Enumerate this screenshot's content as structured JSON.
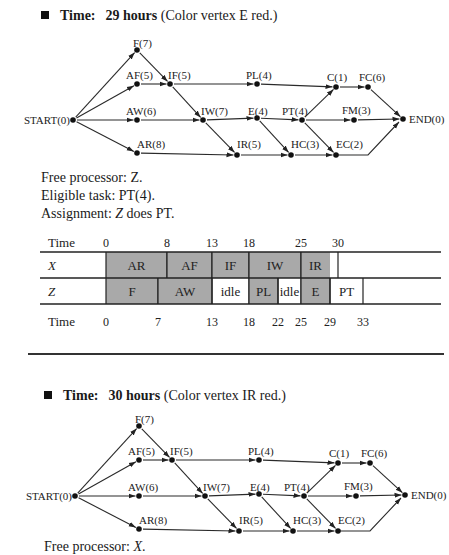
{
  "section1": {
    "heading": {
      "time_label": "Time:",
      "time_value": "29 hours",
      "note": "(Color vertex E red.)"
    },
    "graph": {
      "nodes": [
        {
          "id": "START",
          "label": "START(0)"
        },
        {
          "id": "F",
          "label": "F(7)"
        },
        {
          "id": "AF",
          "label": "AF(5)"
        },
        {
          "id": "IF",
          "label": "IF(5)"
        },
        {
          "id": "AW",
          "label": "AW(6)"
        },
        {
          "id": "IW",
          "label": "IW(7)"
        },
        {
          "id": "AR",
          "label": "AR(8)"
        },
        {
          "id": "IR",
          "label": "IR(5)"
        },
        {
          "id": "PL",
          "label": "PL(4)"
        },
        {
          "id": "E",
          "label": "E(4)"
        },
        {
          "id": "HC",
          "label": "HC(3)"
        },
        {
          "id": "PT",
          "label": "PT(4)"
        },
        {
          "id": "C",
          "label": "C(1)"
        },
        {
          "id": "FC",
          "label": "FC(6)"
        },
        {
          "id": "FM",
          "label": "FM(3)"
        },
        {
          "id": "EC",
          "label": "EC(2)"
        },
        {
          "id": "END",
          "label": "END(0)"
        }
      ],
      "edges": [
        [
          "START",
          "F"
        ],
        [
          "START",
          "AF"
        ],
        [
          "START",
          "AW"
        ],
        [
          "START",
          "AR"
        ],
        [
          "F",
          "IF"
        ],
        [
          "AF",
          "IF"
        ],
        [
          "IF",
          "PL"
        ],
        [
          "IF",
          "IW"
        ],
        [
          "AW",
          "IW"
        ],
        [
          "IW",
          "E"
        ],
        [
          "IW",
          "IR"
        ],
        [
          "AR",
          "IR"
        ],
        [
          "IR",
          "HC"
        ],
        [
          "E",
          "PT"
        ],
        [
          "E",
          "HC"
        ],
        [
          "PL",
          "C"
        ],
        [
          "PT",
          "C"
        ],
        [
          "PT",
          "FM"
        ],
        [
          "PT",
          "EC"
        ],
        [
          "HC",
          "EC"
        ],
        [
          "C",
          "FC"
        ],
        [
          "FC",
          "END"
        ],
        [
          "FM",
          "END"
        ],
        [
          "EC",
          "END"
        ]
      ]
    },
    "free_processor": {
      "prefix": "Free processor: ",
      "value": "Z",
      "suffix": "."
    },
    "eligible_task": "Eligible task: PT(4).",
    "assignment": {
      "prefix": "Assignment: ",
      "processor": "Z",
      "suffix": " does PT."
    },
    "gantt": {
      "time_label": "Time",
      "rows": [
        {
          "processor": "X",
          "tasks": [
            {
              "label": "AR",
              "start": 0,
              "end": 8,
              "type": "task"
            },
            {
              "label": "AF",
              "start": 8,
              "end": 13,
              "type": "task"
            },
            {
              "label": "IF",
              "start": 13,
              "end": 18,
              "type": "task"
            },
            {
              "label": "IW",
              "start": 18,
              "end": 25,
              "type": "task"
            },
            {
              "label": "IR",
              "start": 25,
              "end": 30,
              "type": "task-partial"
            }
          ],
          "ticks": [
            "0",
            "8",
            "13",
            "18",
            "25",
            "30"
          ]
        },
        {
          "processor": "Z",
          "tasks": [
            {
              "label": "F",
              "start": 0,
              "end": 7,
              "type": "task"
            },
            {
              "label": "AW",
              "start": 7,
              "end": 13,
              "type": "task"
            },
            {
              "label": "idle",
              "start": 13,
              "end": 18,
              "type": "idle"
            },
            {
              "label": "PL",
              "start": 18,
              "end": 22,
              "type": "task"
            },
            {
              "label": "idle",
              "start": 22,
              "end": 25,
              "type": "idle"
            },
            {
              "label": "E",
              "start": 25,
              "end": 29,
              "type": "task"
            },
            {
              "label": "PT",
              "start": 29,
              "end": 33,
              "type": "new"
            }
          ],
          "ticks": [
            "0",
            "7",
            "13",
            "18",
            "22",
            "25",
            "29",
            "33"
          ]
        }
      ]
    }
  },
  "section2": {
    "heading": {
      "time_label": "Time:",
      "time_value": "30 hours",
      "note": "(Color vertex IR red.)"
    },
    "free_processor": {
      "prefix": "Free processor: ",
      "value": "X",
      "suffix": "."
    }
  },
  "colors": {
    "task_fill": "#a9a9a9",
    "line": "#2a2a2a",
    "text": "#1a1a1a"
  }
}
